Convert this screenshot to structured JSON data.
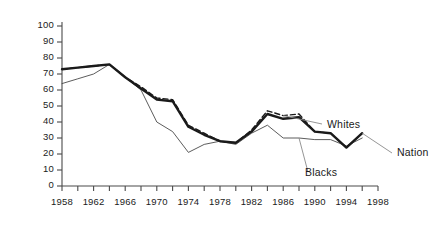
{
  "chart_data": {
    "type": "line",
    "title": "",
    "subtitle": "",
    "xlabel": "",
    "ylabel": "",
    "xlim": [
      1958,
      1998
    ],
    "ylim": [
      0,
      100
    ],
    "grid": false,
    "legend_position": "inline-right",
    "y_ticks": [
      0,
      10,
      20,
      30,
      40,
      50,
      60,
      70,
      80,
      90,
      100
    ],
    "y_tick_labels": [
      "0",
      "10",
      "20",
      "30",
      "40",
      "50",
      "60",
      "70",
      "80",
      "90",
      "100"
    ],
    "x_ticks": [
      1958,
      1960,
      1962,
      1964,
      1966,
      1968,
      1970,
      1972,
      1974,
      1976,
      1978,
      1980,
      1982,
      1984,
      1986,
      1988,
      1990,
      1992,
      1994,
      1996,
      1998
    ],
    "x_tick_labels_shown": [
      "1958",
      "1962",
      "1966",
      "1970",
      "1974",
      "1978",
      "1982",
      "1986",
      "1990",
      "1994",
      "1998"
    ],
    "x": [
      1958,
      1960,
      1962,
      1964,
      1966,
      1968,
      1970,
      1972,
      1974,
      1976,
      1978,
      1980,
      1982,
      1984,
      1986,
      1988,
      1990,
      1992,
      1994,
      1996
    ],
    "series": [
      {
        "name": "Nation",
        "style": "thick-solid",
        "color": "#1a1a1a",
        "values": [
          73,
          74,
          75,
          76,
          68,
          61,
          54,
          53,
          37,
          32,
          28,
          27,
          34,
          45,
          42,
          43,
          34,
          33,
          24,
          33
        ]
      },
      {
        "name": "Whites",
        "style": "dashed",
        "color": "#1a1a1a",
        "values": [
          73,
          74,
          75,
          76,
          68,
          62,
          55,
          54,
          38,
          33,
          28,
          27,
          35,
          47,
          44,
          45,
          34,
          33,
          24,
          33
        ]
      },
      {
        "name": "Blacks",
        "style": "thin-solid",
        "color": "#4a4a4a",
        "values": [
          64,
          67,
          70,
          76,
          68,
          60,
          40,
          34,
          21,
          26,
          28,
          26,
          33,
          38,
          30,
          30,
          29,
          29,
          25,
          30
        ]
      }
    ],
    "annotations": [
      {
        "text": "Whites",
        "for_series": "Whites"
      },
      {
        "text": "Blacks",
        "for_series": "Blacks"
      },
      {
        "text": "Nation",
        "for_series": "Nation"
      }
    ]
  }
}
